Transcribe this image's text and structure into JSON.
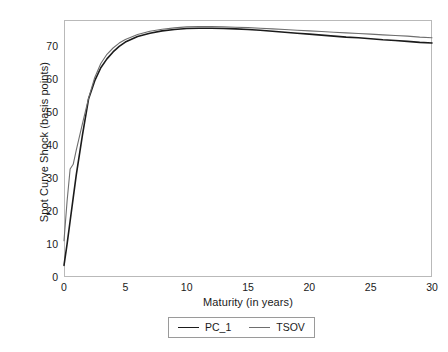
{
  "chart_data": {
    "type": "line",
    "title": "",
    "xlabel": "Maturity (in years)",
    "ylabel": "Spot Curve Shock (basis points)",
    "xlim": [
      0,
      30
    ],
    "ylim": [
      0,
      78
    ],
    "xticks": [
      0,
      5,
      10,
      15,
      20,
      25,
      30
    ],
    "yticks": [
      0,
      10,
      20,
      30,
      40,
      50,
      60,
      70
    ],
    "grid": false,
    "legend_position": "bottom-center",
    "frame": true,
    "x": [
      0,
      0.25,
      0.5,
      0.75,
      1,
      1.5,
      2,
      2.5,
      3,
      3.5,
      4,
      4.5,
      5,
      6,
      7,
      8,
      9,
      10,
      11,
      12,
      13,
      14,
      15,
      16,
      17,
      18,
      19,
      20,
      21,
      22,
      23,
      24,
      25,
      26,
      27,
      28,
      29,
      30
    ],
    "series": [
      {
        "name": "PC_1",
        "color": "#1b1b1b",
        "width": 1.6,
        "values": [
          3.5,
          10.0,
          17.0,
          24.0,
          31.0,
          43.0,
          54.0,
          59.5,
          63.5,
          66.2,
          68.3,
          70.0,
          71.3,
          73.0,
          74.0,
          74.7,
          75.1,
          75.4,
          75.5,
          75.5,
          75.4,
          75.3,
          75.1,
          74.9,
          74.6,
          74.3,
          74.0,
          73.7,
          73.4,
          73.1,
          72.8,
          72.6,
          72.3,
          72.0,
          71.8,
          71.5,
          71.2,
          71.0
        ]
      },
      {
        "name": "TSOV",
        "color": "#6e6e6e",
        "width": 1.1,
        "values": [
          11.0,
          23.0,
          32.8,
          34.2,
          38.5,
          46.5,
          54.2,
          60.5,
          64.8,
          67.6,
          69.5,
          71.0,
          72.1,
          73.6,
          74.6,
          75.2,
          75.6,
          75.9,
          76.0,
          76.0,
          75.9,
          75.8,
          75.7,
          75.5,
          75.3,
          75.1,
          74.9,
          74.7,
          74.5,
          74.3,
          74.1,
          73.9,
          73.7,
          73.5,
          73.3,
          73.1,
          72.8,
          72.6
        ]
      }
    ],
    "legend": [
      {
        "label": "PC_1",
        "swatch": "line-black"
      },
      {
        "label": "TSOV",
        "swatch": "line-gray"
      }
    ]
  },
  "axis": {
    "x_tick_labels": [
      "0",
      "5",
      "10",
      "15",
      "20",
      "25",
      "30"
    ],
    "y_tick_labels": [
      "0",
      "10",
      "20",
      "30",
      "40",
      "50",
      "60",
      "70"
    ],
    "x_title": "Maturity (in years)",
    "y_title": "Spot Curve Shock (basis points)"
  },
  "legend": {
    "items": [
      {
        "label": "PC_1"
      },
      {
        "label": "TSOV"
      }
    ]
  }
}
